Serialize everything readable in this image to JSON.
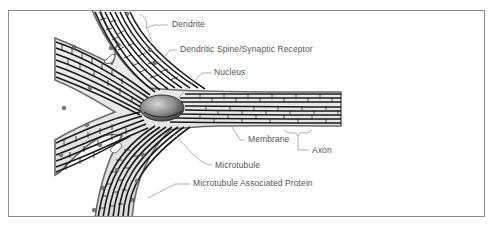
{
  "diagram": {
    "labels": {
      "dendrite": "Dendrite",
      "dendritic_spine": "Dendritic Spine/Synaptic Receptor",
      "nucleus": "Nucleus",
      "membrane": "Membrane",
      "axon": "Axon",
      "microtubule": "Microtubule",
      "map": "Microtubule Associated Protein"
    },
    "colors": {
      "frame": "#8a8a8a",
      "label_text": "#555555",
      "leader_line": "#9a9a9a",
      "microtubule": "#1a1a1a",
      "membrane": "#6a6a6a",
      "nucleus": "#7a7a7a"
    }
  }
}
